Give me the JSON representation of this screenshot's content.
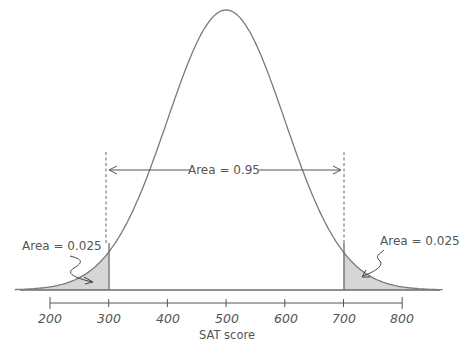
{
  "chart_data": {
    "type": "area",
    "title": "",
    "xlabel": "SAT score",
    "ylabel": "",
    "xlim": [
      200,
      800
    ],
    "x_ticks": [
      200,
      300,
      400,
      500,
      600,
      700,
      800
    ],
    "x_tick_labels": [
      "200",
      "300",
      "400",
      "500",
      "600",
      "700",
      "800"
    ],
    "distribution": {
      "kind": "normal",
      "mean": 500,
      "sd": 100
    },
    "shaded_regions": [
      {
        "from": null,
        "to": 300,
        "area": 0.025
      },
      {
        "from": 700,
        "to": null,
        "area": 0.025
      }
    ],
    "central_region": {
      "from": 300,
      "to": 700,
      "area": 0.95
    },
    "annotations": [
      {
        "text": "Area = 0.95",
        "position": "center, between dashed lines"
      },
      {
        "text": "Area = 0.025",
        "position": "left tail"
      },
      {
        "text": "Area = 0.025",
        "position": "right tail"
      }
    ],
    "grid": false,
    "legend": null
  },
  "labels": {
    "center_area": "Area = 0.95",
    "left_area": "Area = 0.025",
    "right_area": "Area = 0.025",
    "xlabel": "SAT score",
    "ticks": [
      "200",
      "300",
      "400",
      "500",
      "600",
      "700",
      "800"
    ]
  },
  "colors": {
    "curve": "#7a7a7a",
    "shade": "#d6d6d6",
    "text": "#555555",
    "axis": "#555555"
  }
}
